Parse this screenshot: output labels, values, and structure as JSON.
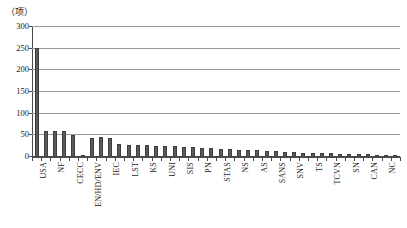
{
  "chart_data": {
    "type": "bar",
    "title": "",
    "subtitle": "",
    "xlabel": "",
    "ylabel": "（项）",
    "ylim": [
      0,
      300
    ],
    "ytick_values": [
      300,
      250,
      200,
      150,
      100,
      50,
      0
    ],
    "ytick_labels": [
      "300",
      "250",
      "200",
      "150",
      "100",
      "50",
      "0"
    ],
    "grid": "horizontal",
    "legend": "none",
    "bar_color": "#5b5b5b",
    "bar_edge_color": "#3d3d3d",
    "axis_color": "#4a4a4a",
    "gridline_color": "#9a9a9a",
    "categories": [
      "USA",
      "BS",
      "NF",
      "DIN",
      "CECC",
      "GOST",
      "EN/HD/ENV",
      "JIS",
      "IEC",
      "CSA",
      "LST",
      "SFS",
      "KS",
      "NBN",
      "UNI",
      "NEN",
      "SIS",
      "ONORM",
      "PN",
      "DS",
      "STAS",
      "CEI",
      "NS",
      "UNE",
      "AS",
      "SABS",
      "SANS",
      "MS",
      "SNV",
      "BDS",
      "TS",
      "INS",
      "TCVN",
      "IS",
      "SN",
      "EVS",
      "CAN",
      "NZS",
      "NC",
      "JUS"
    ],
    "visible_tick_labels": [
      "USA",
      "NF",
      "CECC",
      "EN/HD/ENV",
      "IEC",
      "LST",
      "KS",
      "UNI",
      "SIS",
      "PN",
      "STAS",
      "NS",
      "AS",
      "SANS",
      "SNV",
      "TS",
      "TCVN",
      "SN",
      "CAN",
      "NC"
    ],
    "values": [
      250,
      57,
      57,
      57,
      49,
      3,
      41,
      43,
      42,
      28,
      26,
      26,
      25,
      24,
      23,
      22,
      21,
      20,
      19,
      18,
      17,
      16,
      15,
      14,
      13,
      12,
      11,
      10,
      9,
      8,
      7,
      6,
      6,
      5,
      5,
      4,
      4,
      3,
      3,
      2
    ],
    "max_value": 250,
    "max_category": "USA"
  }
}
